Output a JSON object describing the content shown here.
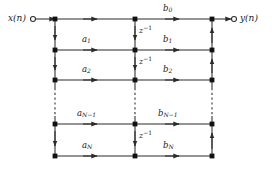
{
  "diagram": {
    "stroke_color": "#2b2b2b",
    "node_color": "#111111",
    "terminal_fill": "#ffffff",
    "io": {
      "input_label": "x(n)",
      "output_label": "y(n)"
    },
    "delay_label": "z",
    "delay_exponent": "−1",
    "delay_count_visible": 3,
    "feedback_coefficients": [
      {
        "base": "a",
        "sub": "1"
      },
      {
        "base": "a",
        "sub": "2"
      },
      {
        "base": "a",
        "sub": "N−1"
      },
      {
        "base": "a",
        "sub": "N"
      }
    ],
    "feedforward_coefficients": [
      {
        "base": "b",
        "sub": "0"
      },
      {
        "base": "b",
        "sub": "1"
      },
      {
        "base": "b",
        "sub": "2"
      },
      {
        "base": "b",
        "sub": "N−1"
      },
      {
        "base": "b",
        "sub": "N"
      }
    ],
    "geometry": {
      "left_rail_x": 55,
      "mid_rail_x": 135,
      "right_rail_x": 212,
      "row_y": [
        19,
        50,
        80,
        124,
        156
      ],
      "input_terminal_x": 33,
      "output_terminal_x": 234,
      "dashed_gap_top": 88,
      "dashed_gap_bottom": 116
    }
  }
}
